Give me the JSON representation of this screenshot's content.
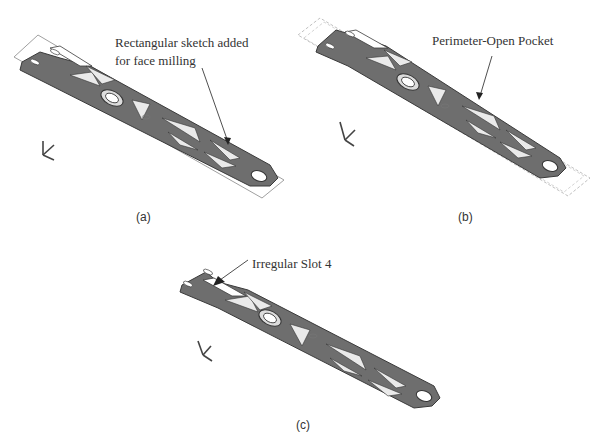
{
  "figure": {
    "panels": [
      {
        "id": "a",
        "label": "(a)",
        "callout_line1": "Rectangular sketch added",
        "callout_line2": "for face milling",
        "boundary_style": "solid"
      },
      {
        "id": "b",
        "label": "(b)",
        "callout_line1": "Perimeter-Open Pocket",
        "boundary_style": "dashed"
      },
      {
        "id": "c",
        "label": "(c)",
        "callout_line1": "Irregular Slot 4",
        "boundary_style": "none"
      }
    ],
    "axis_triad": {
      "labels": [
        "Y",
        "Y",
        "X"
      ]
    },
    "colors": {
      "part_fill": "#6e6e6e",
      "part_edge": "#3c3c3c",
      "sketch_line": "#9a9a9a",
      "arrow": "#222222",
      "text": "#333333"
    }
  }
}
